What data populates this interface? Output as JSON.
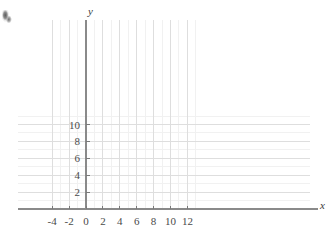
{
  "page": {
    "background_color": "#ffffff",
    "artifact": {
      "name": "corner-smudge",
      "description": "small dark scan smudge at top-left corner"
    }
  },
  "colors": {
    "minor_grid": "#f1f1f1",
    "major_grid": "#dedede",
    "axis": "#8a8a8a",
    "tick_mark": "#7a7a7a",
    "label_text": "#4a4a4a",
    "axis_name_text": "#3a3a3a"
  },
  "axes": {
    "x_axis_label": "x",
    "y_axis_label": "y",
    "x_tick_labels": [
      "-4",
      "-2",
      "0",
      "2",
      "4",
      "6",
      "8",
      "10",
      "12"
    ],
    "x_tick_values": [
      -4,
      -2,
      0,
      2,
      4,
      6,
      8,
      10,
      12
    ],
    "y_tick_labels": [
      "2",
      "4",
      "6",
      "8",
      "10"
    ],
    "y_tick_values": [
      2,
      4,
      6,
      8,
      10
    ]
  },
  "chart_data": {
    "type": "scatter",
    "title": "",
    "subtitle": "",
    "xlabel": "x",
    "ylabel": "y",
    "series": [
      {
        "name": "",
        "x": [],
        "y": []
      }
    ],
    "x": [],
    "values": [],
    "categories": [],
    "annotations": [],
    "legend": {
      "entries": [],
      "position": "none"
    },
    "grid": {
      "visible": true,
      "minor_step_x": 1,
      "minor_step_y": 1,
      "major_step_x": 2,
      "major_step_y": 2,
      "x_range": [
        -4,
        13
      ],
      "y_range": [
        0,
        11.5
      ]
    },
    "xlim": [
      -4,
      13
    ],
    "ylim": [
      0,
      11.5
    ],
    "xticks": [
      -4,
      -2,
      0,
      2,
      4,
      6,
      8,
      10,
      12
    ],
    "yticks": [
      2,
      4,
      6,
      8,
      10
    ]
  },
  "geometry": {
    "origin_px": {
      "x": 86.0,
      "y": 209.0
    },
    "unit_px": 8.45,
    "grid_left_px": 18.0,
    "grid_right_px": 310.0,
    "grid_top_px": 20.0,
    "grid_bottom_px": 209.0,
    "x_axis_end_px": 318.0,
    "y_axis_top_px": 20.0
  }
}
